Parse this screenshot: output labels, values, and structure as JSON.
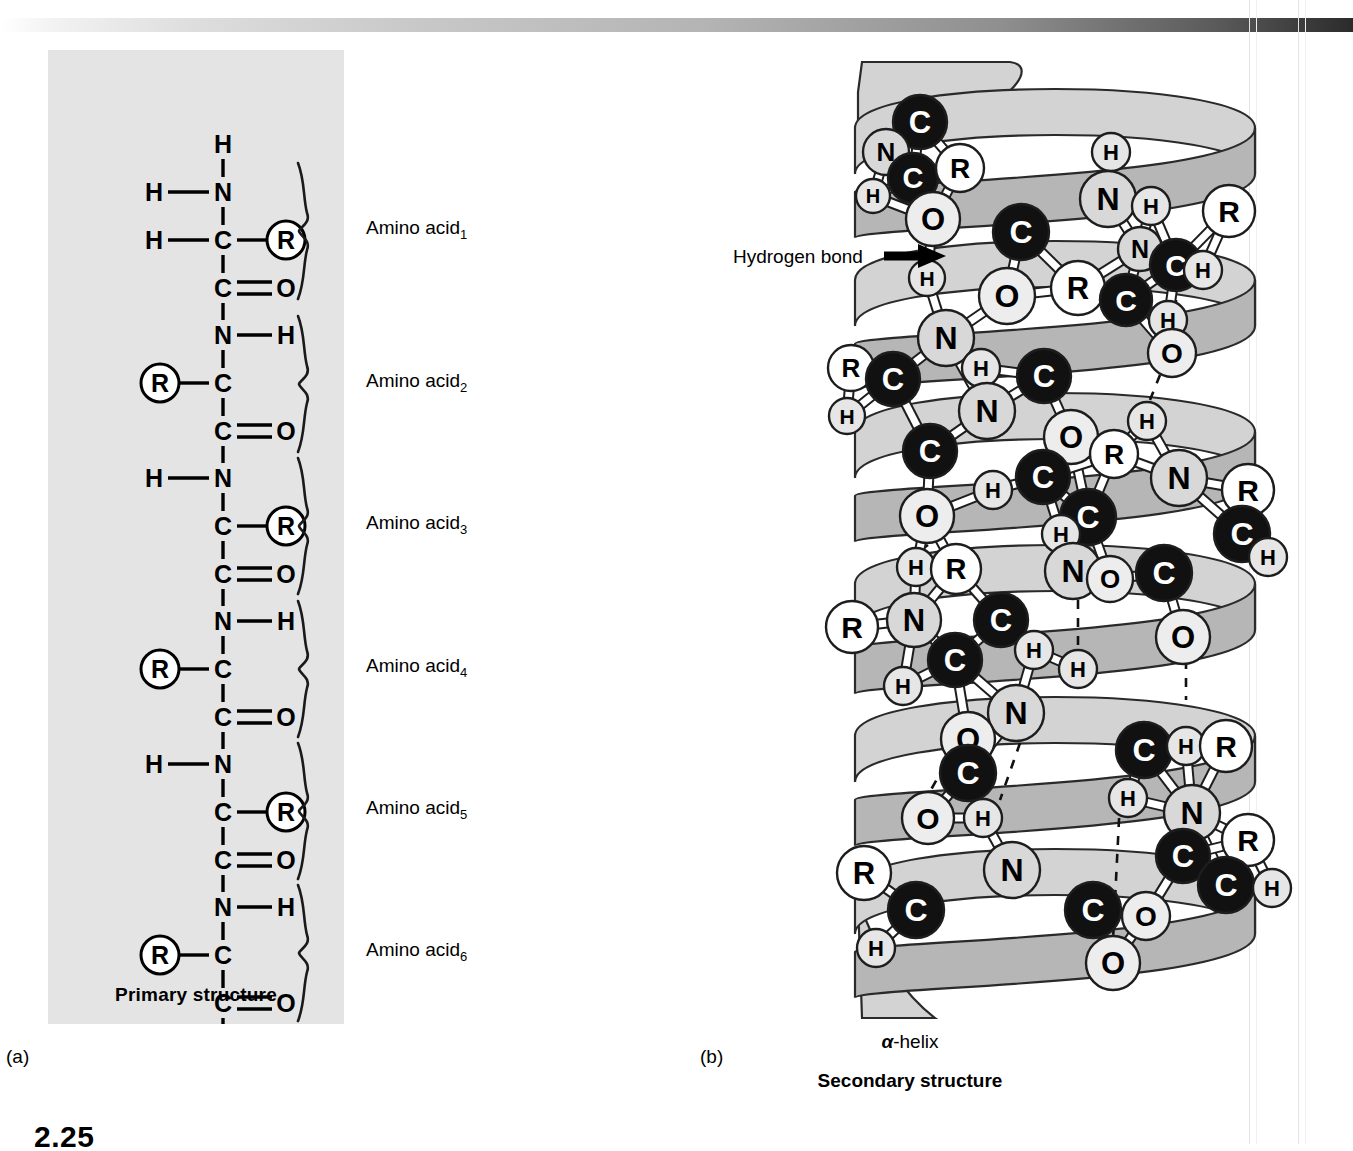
{
  "figure": {
    "number": "2.25",
    "panel_a_letter": "(a)",
    "panel_b_letter": "(b)"
  },
  "panel_a": {
    "title": "Primary structure",
    "background_color": "#e4e4e4",
    "amino_acid_labels": [
      {
        "text": "Amino acid",
        "subscript": "1",
        "y": 181
      },
      {
        "text": "Amino acid",
        "subscript": "2",
        "y": 334
      },
      {
        "text": "Amino acid",
        "subscript": "3",
        "y": 476
      },
      {
        "text": "Amino acid",
        "subscript": "4",
        "y": 619
      },
      {
        "text": "Amino acid",
        "subscript": "5",
        "y": 761
      },
      {
        "text": "Amino acid",
        "subscript": "6",
        "y": 903
      }
    ],
    "chain_atoms": [
      {
        "label": "H",
        "x": 175,
        "y": 94,
        "kind": "plain"
      },
      {
        "label": "H",
        "x": 106,
        "y": 142,
        "kind": "plain"
      },
      {
        "label": "N",
        "x": 175,
        "y": 142,
        "kind": "plain"
      },
      {
        "label": "H",
        "x": 106,
        "y": 190,
        "kind": "plain"
      },
      {
        "label": "C",
        "x": 175,
        "y": 190,
        "kind": "plain"
      },
      {
        "label": "R",
        "x": 238,
        "y": 190,
        "kind": "circled"
      },
      {
        "label": "C",
        "x": 175,
        "y": 238,
        "kind": "plain"
      },
      {
        "label": "O",
        "x": 238,
        "y": 238,
        "kind": "plain"
      },
      {
        "label": "N",
        "x": 175,
        "y": 285,
        "kind": "plain"
      },
      {
        "label": "H",
        "x": 238,
        "y": 285,
        "kind": "plain"
      },
      {
        "label": "R",
        "x": 112,
        "y": 333,
        "kind": "circled"
      },
      {
        "label": "C",
        "x": 175,
        "y": 333,
        "kind": "plain"
      },
      {
        "label": "C",
        "x": 175,
        "y": 381,
        "kind": "plain"
      },
      {
        "label": "O",
        "x": 238,
        "y": 381,
        "kind": "plain"
      },
      {
        "label": "H",
        "x": 106,
        "y": 428,
        "kind": "plain"
      },
      {
        "label": "N",
        "x": 175,
        "y": 428,
        "kind": "plain"
      },
      {
        "label": "C",
        "x": 175,
        "y": 476,
        "kind": "plain"
      },
      {
        "label": "R",
        "x": 238,
        "y": 476,
        "kind": "circled"
      },
      {
        "label": "C",
        "x": 175,
        "y": 524,
        "kind": "plain"
      },
      {
        "label": "O",
        "x": 238,
        "y": 524,
        "kind": "plain"
      },
      {
        "label": "N",
        "x": 175,
        "y": 571,
        "kind": "plain"
      },
      {
        "label": "H",
        "x": 238,
        "y": 571,
        "kind": "plain"
      },
      {
        "label": "R",
        "x": 112,
        "y": 619,
        "kind": "circled"
      },
      {
        "label": "C",
        "x": 175,
        "y": 619,
        "kind": "plain"
      },
      {
        "label": "C",
        "x": 175,
        "y": 667,
        "kind": "plain"
      },
      {
        "label": "O",
        "x": 238,
        "y": 667,
        "kind": "plain"
      },
      {
        "label": "H",
        "x": 106,
        "y": 714,
        "kind": "plain"
      },
      {
        "label": "N",
        "x": 175,
        "y": 714,
        "kind": "plain"
      },
      {
        "label": "C",
        "x": 175,
        "y": 762,
        "kind": "plain"
      },
      {
        "label": "R",
        "x": 238,
        "y": 762,
        "kind": "circled"
      },
      {
        "label": "C",
        "x": 175,
        "y": 810,
        "kind": "plain"
      },
      {
        "label": "O",
        "x": 238,
        "y": 810,
        "kind": "plain"
      },
      {
        "label": "N",
        "x": 175,
        "y": 857,
        "kind": "plain"
      },
      {
        "label": "H",
        "x": 238,
        "y": 857,
        "kind": "plain"
      },
      {
        "label": "R",
        "x": 112,
        "y": 905,
        "kind": "circled"
      },
      {
        "label": "C",
        "x": 175,
        "y": 905,
        "kind": "plain"
      },
      {
        "label": "C",
        "x": 175,
        "y": 953,
        "kind": "plain"
      },
      {
        "label": "O",
        "x": 238,
        "y": 953,
        "kind": "plain"
      }
    ]
  },
  "panel_b": {
    "hydrogen_bond_label": "Hydrogen bond",
    "helix_name_alpha": "α",
    "helix_name_rest": "-helix",
    "title": "Secondary structure",
    "ribbon_light": "#d3d3d3",
    "ribbon_dark": "#b6b6b6",
    "atom_colors": {
      "carbon_fill": "#111111",
      "carbon_text": "#ffffff",
      "nitrogen_fill": "#d8d8d8",
      "oxygen_fill": "#ededed",
      "hydrogen_fill": "#e6e6e6",
      "r_group_fill": "#ffffff",
      "label_text": "#000000"
    },
    "atoms": [
      {
        "label": "C",
        "x": 920,
        "y": 122,
        "r": 27,
        "kind": "C"
      },
      {
        "label": "N",
        "x": 886,
        "y": 152,
        "r": 23,
        "kind": "N"
      },
      {
        "label": "C",
        "x": 913,
        "y": 178,
        "r": 25,
        "kind": "C"
      },
      {
        "label": "R",
        "x": 960,
        "y": 168,
        "r": 24,
        "kind": "R"
      },
      {
        "label": "H",
        "x": 873,
        "y": 196,
        "r": 17,
        "kind": "H"
      },
      {
        "label": "O",
        "x": 933,
        "y": 219,
        "r": 27,
        "kind": "O"
      },
      {
        "label": "H",
        "x": 1111,
        "y": 152,
        "r": 19,
        "kind": "H"
      },
      {
        "label": "N",
        "x": 1108,
        "y": 199,
        "r": 28,
        "kind": "N"
      },
      {
        "label": "H",
        "x": 1151,
        "y": 206,
        "r": 19,
        "kind": "H"
      },
      {
        "label": "C",
        "x": 1021,
        "y": 232,
        "r": 28,
        "kind": "C"
      },
      {
        "label": "N",
        "x": 1140,
        "y": 249,
        "r": 22,
        "kind": "N"
      },
      {
        "label": "C",
        "x": 1176,
        "y": 265,
        "r": 26,
        "kind": "C"
      },
      {
        "label": "R",
        "x": 1229,
        "y": 211,
        "r": 26,
        "kind": "R"
      },
      {
        "label": "H",
        "x": 1203,
        "y": 270,
        "r": 19,
        "kind": "H"
      },
      {
        "label": "H",
        "x": 927,
        "y": 278,
        "r": 18,
        "kind": "H"
      },
      {
        "label": "O",
        "x": 1007,
        "y": 296,
        "r": 28,
        "kind": "O"
      },
      {
        "label": "R",
        "x": 1078,
        "y": 288,
        "r": 27,
        "kind": "R"
      },
      {
        "label": "C",
        "x": 1126,
        "y": 300,
        "r": 26,
        "kind": "C"
      },
      {
        "label": "H",
        "x": 1168,
        "y": 320,
        "r": 19,
        "kind": "H"
      },
      {
        "label": "O",
        "x": 1172,
        "y": 353,
        "r": 24,
        "kind": "O"
      },
      {
        "label": "N",
        "x": 946,
        "y": 338,
        "r": 28,
        "kind": "N"
      },
      {
        "label": "H",
        "x": 981,
        "y": 368,
        "r": 19,
        "kind": "H"
      },
      {
        "label": "R",
        "x": 851,
        "y": 368,
        "r": 23,
        "kind": "R"
      },
      {
        "label": "C",
        "x": 893,
        "y": 379,
        "r": 27,
        "kind": "C"
      },
      {
        "label": "C",
        "x": 1044,
        "y": 376,
        "r": 27,
        "kind": "C"
      },
      {
        "label": "H",
        "x": 1147,
        "y": 421,
        "r": 19,
        "kind": "H"
      },
      {
        "label": "H",
        "x": 847,
        "y": 416,
        "r": 18,
        "kind": "H"
      },
      {
        "label": "N",
        "x": 987,
        "y": 411,
        "r": 28,
        "kind": "N"
      },
      {
        "label": "O",
        "x": 1071,
        "y": 437,
        "r": 27,
        "kind": "O"
      },
      {
        "label": "R",
        "x": 1114,
        "y": 454,
        "r": 24,
        "kind": "R"
      },
      {
        "label": "C",
        "x": 930,
        "y": 451,
        "r": 27,
        "kind": "C"
      },
      {
        "label": "N",
        "x": 1179,
        "y": 478,
        "r": 28,
        "kind": "N"
      },
      {
        "label": "C",
        "x": 1043,
        "y": 477,
        "r": 27,
        "kind": "C"
      },
      {
        "label": "H",
        "x": 993,
        "y": 490,
        "r": 19,
        "kind": "H"
      },
      {
        "label": "R",
        "x": 1248,
        "y": 490,
        "r": 26,
        "kind": "R"
      },
      {
        "label": "O",
        "x": 927,
        "y": 516,
        "r": 27,
        "kind": "O"
      },
      {
        "label": "C",
        "x": 1088,
        "y": 517,
        "r": 28,
        "kind": "C"
      },
      {
        "label": "H",
        "x": 1061,
        "y": 534,
        "r": 19,
        "kind": "H"
      },
      {
        "label": "C",
        "x": 1242,
        "y": 534,
        "r": 28,
        "kind": "C"
      },
      {
        "label": "H",
        "x": 1268,
        "y": 557,
        "r": 19,
        "kind": "H"
      },
      {
        "label": "H",
        "x": 916,
        "y": 567,
        "r": 19,
        "kind": "H"
      },
      {
        "label": "R",
        "x": 956,
        "y": 569,
        "r": 25,
        "kind": "R"
      },
      {
        "label": "N",
        "x": 1073,
        "y": 571,
        "r": 28,
        "kind": "N"
      },
      {
        "label": "O",
        "x": 1110,
        "y": 579,
        "r": 23,
        "kind": "O"
      },
      {
        "label": "C",
        "x": 1164,
        "y": 573,
        "r": 28,
        "kind": "C"
      },
      {
        "label": "N",
        "x": 914,
        "y": 620,
        "r": 27,
        "kind": "N"
      },
      {
        "label": "R",
        "x": 852,
        "y": 627,
        "r": 26,
        "kind": "R"
      },
      {
        "label": "C",
        "x": 1001,
        "y": 620,
        "r": 27,
        "kind": "C"
      },
      {
        "label": "H",
        "x": 1034,
        "y": 650,
        "r": 19,
        "kind": "H"
      },
      {
        "label": "O",
        "x": 1183,
        "y": 637,
        "r": 27,
        "kind": "O"
      },
      {
        "label": "C",
        "x": 955,
        "y": 660,
        "r": 27,
        "kind": "C"
      },
      {
        "label": "H",
        "x": 903,
        "y": 686,
        "r": 19,
        "kind": "H"
      },
      {
        "label": "H",
        "x": 1078,
        "y": 669,
        "r": 19,
        "kind": "H"
      },
      {
        "label": "N",
        "x": 1016,
        "y": 713,
        "r": 28,
        "kind": "N"
      },
      {
        "label": "C",
        "x": 1144,
        "y": 750,
        "r": 28,
        "kind": "C"
      },
      {
        "label": "O",
        "x": 968,
        "y": 739,
        "r": 27,
        "kind": "O"
      },
      {
        "label": "H",
        "x": 1186,
        "y": 746,
        "r": 19,
        "kind": "H"
      },
      {
        "label": "R",
        "x": 1226,
        "y": 746,
        "r": 26,
        "kind": "R"
      },
      {
        "label": "C",
        "x": 968,
        "y": 773,
        "r": 28,
        "kind": "C"
      },
      {
        "label": "H",
        "x": 1128,
        "y": 798,
        "r": 19,
        "kind": "H"
      },
      {
        "label": "N",
        "x": 1192,
        "y": 813,
        "r": 28,
        "kind": "N"
      },
      {
        "label": "O",
        "x": 928,
        "y": 818,
        "r": 26,
        "kind": "O"
      },
      {
        "label": "H",
        "x": 983,
        "y": 818,
        "r": 19,
        "kind": "H"
      },
      {
        "label": "R",
        "x": 1248,
        "y": 840,
        "r": 26,
        "kind": "R"
      },
      {
        "label": "C",
        "x": 1183,
        "y": 856,
        "r": 27,
        "kind": "C"
      },
      {
        "label": "N",
        "x": 1012,
        "y": 870,
        "r": 28,
        "kind": "N"
      },
      {
        "label": "R",
        "x": 864,
        "y": 873,
        "r": 27,
        "kind": "R"
      },
      {
        "label": "C",
        "x": 1226,
        "y": 885,
        "r": 28,
        "kind": "C"
      },
      {
        "label": "H",
        "x": 1272,
        "y": 888,
        "r": 19,
        "kind": "H"
      },
      {
        "label": "C",
        "x": 916,
        "y": 910,
        "r": 28,
        "kind": "C"
      },
      {
        "label": "C",
        "x": 1093,
        "y": 910,
        "r": 28,
        "kind": "C"
      },
      {
        "label": "O",
        "x": 1146,
        "y": 916,
        "r": 24,
        "kind": "O"
      },
      {
        "label": "H",
        "x": 876,
        "y": 948,
        "r": 19,
        "kind": "H"
      },
      {
        "label": "O",
        "x": 1113,
        "y": 963,
        "r": 27,
        "kind": "O"
      }
    ]
  }
}
